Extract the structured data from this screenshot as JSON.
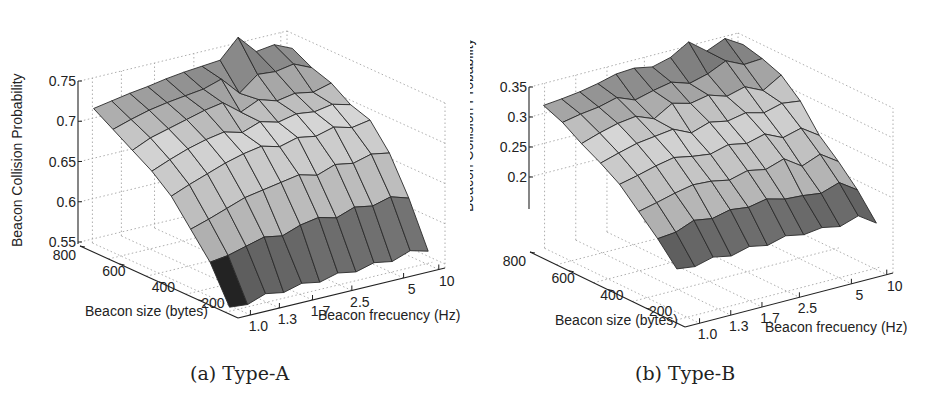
{
  "figure": {
    "panels": [
      {
        "caption": "(a) Type-A",
        "zlabel": "Beacon Collision Probability",
        "xlabel": "Beacon size (bytes)",
        "ylabel": "Beacon frecuency (Hz)"
      },
      {
        "caption": "(b) Type-B",
        "zlabel": "Beacon Collision Probability",
        "xlabel": "Beacon size (bytes)",
        "ylabel": "Beacon frecuency (Hz)"
      }
    ]
  },
  "chart_data": [
    {
      "type": "surface",
      "title": "(a) Type-A",
      "xlabel": "Beacon size (bytes)",
      "ylabel": "Beacon frecuency (Hz)",
      "zlabel": "Beacon Collision Probability",
      "x_ticks": [
        "200",
        "400",
        "600",
        "800"
      ],
      "y_ticks": [
        "1.0",
        "1.3",
        "1.7",
        "2.5",
        "5",
        "10"
      ],
      "z_ticks": [
        "0.55",
        "0.6",
        "0.65",
        "0.7",
        "0.75"
      ],
      "zlim": [
        0.55,
        0.75
      ],
      "grid": true,
      "note": "Rows = beacon size from 800 (back-left) down to ~100; columns = beacon frequency grid from 1.0 to 10 Hz. Values estimated visually.",
      "x": [
        800,
        700,
        600,
        500,
        400,
        300,
        200,
        100
      ],
      "y": [
        1.0,
        1.1,
        1.2,
        1.3,
        1.5,
        1.7,
        2.0,
        2.5,
        3.3,
        5,
        7,
        10
      ],
      "z": [
        [
          0.72,
          0.724,
          0.728,
          0.731,
          0.735,
          0.738,
          0.74,
          0.742,
          0.765,
          0.742,
          0.745,
          0.735
        ],
        [
          0.705,
          0.712,
          0.718,
          0.722,
          0.725,
          0.728,
          0.735,
          0.712,
          0.73,
          0.728,
          0.732,
          0.722
        ],
        [
          0.69,
          0.7,
          0.706,
          0.712,
          0.718,
          0.722,
          0.705,
          0.715,
          0.708,
          0.712,
          0.708,
          0.714
        ],
        [
          0.675,
          0.684,
          0.692,
          0.698,
          0.702,
          0.696,
          0.704,
          0.698,
          0.703,
          0.7,
          0.704,
          0.698
        ],
        [
          0.655,
          0.664,
          0.672,
          0.68,
          0.686,
          0.69,
          0.684,
          0.69,
          0.686,
          0.692,
          0.686,
          0.69
        ],
        [
          0.625,
          0.632,
          0.64,
          0.648,
          0.652,
          0.656,
          0.66,
          0.654,
          0.662,
          0.658,
          0.664,
          0.66
        ],
        [
          0.595,
          0.598,
          0.604,
          0.61,
          0.606,
          0.614,
          0.618,
          0.612,
          0.62,
          0.616,
          0.622,
          0.615
        ],
        [
          0.55,
          0.548,
          0.556,
          0.552,
          0.558,
          0.554,
          0.56,
          0.556,
          0.562,
          0.558,
          0.566,
          0.56
        ]
      ]
    },
    {
      "type": "surface",
      "title": "(b) Type-B",
      "xlabel": "Beacon size (bytes)",
      "ylabel": "Beacon frecuency (Hz)",
      "zlabel": "Beacon Collision Probability",
      "x_ticks": [
        "200",
        "400",
        "600",
        "800"
      ],
      "y_ticks": [
        "1.0",
        "1.3",
        "1.7",
        "2.5",
        "5",
        "10"
      ],
      "z_ticks": [
        "0.2",
        "0.25",
        "0.3",
        "0.35"
      ],
      "zlim": [
        0.15,
        0.35
      ],
      "grid": true,
      "note": "Rows = beacon size from 800 (back-left) down to ~100; columns = beacon frequency grid from 1.0 to 10 Hz. Values estimated visually.",
      "x": [
        800,
        700,
        600,
        500,
        400,
        300,
        200,
        100
      ],
      "y": [
        1.0,
        1.1,
        1.2,
        1.3,
        1.5,
        1.7,
        2.0,
        2.5,
        3.3,
        5,
        7,
        10
      ],
      "z": [
        [
          0.325,
          0.328,
          0.332,
          0.338,
          0.346,
          0.348,
          0.342,
          0.35,
          0.368,
          0.345,
          0.358,
          0.34
        ],
        [
          0.312,
          0.318,
          0.322,
          0.33,
          0.318,
          0.326,
          0.332,
          0.322,
          0.33,
          0.344,
          0.33,
          0.332
        ],
        [
          0.292,
          0.302,
          0.31,
          0.314,
          0.302,
          0.32,
          0.312,
          0.318,
          0.308,
          0.316,
          0.302,
          0.32
        ],
        [
          0.275,
          0.284,
          0.292,
          0.296,
          0.3,
          0.286,
          0.296,
          0.29,
          0.296,
          0.288,
          0.296,
          0.292
        ],
        [
          0.255,
          0.262,
          0.27,
          0.276,
          0.27,
          0.266,
          0.274,
          0.268,
          0.276,
          0.262,
          0.27,
          0.25
        ],
        [
          0.225,
          0.232,
          0.24,
          0.246,
          0.244,
          0.238,
          0.246,
          0.24,
          0.25,
          0.23,
          0.242,
          0.222
        ],
        [
          0.195,
          0.198,
          0.21,
          0.205,
          0.212,
          0.208,
          0.214,
          0.206,
          0.204,
          0.2,
          0.21,
          0.19
        ],
        [
          0.16,
          0.156,
          0.164,
          0.158,
          0.166,
          0.16,
          0.168,
          0.162,
          0.166,
          0.16,
          0.17,
          0.15
        ]
      ]
    }
  ],
  "layout": {
    "panels": [
      {
        "z_axis_x": 78,
        "z_top": 81,
        "z_bottom": 242,
        "corner_back": [
          80,
          246
        ],
        "corner_front": [
          238,
          318
        ],
        "corner_right": [
          445,
          268
        ],
        "x_tick_pos": [
          0.82,
          0.58,
          0.33,
          0.08
        ],
        "y_tick_pos": [
          0.06,
          0.2,
          0.36,
          0.55,
          0.8,
          0.97
        ],
        "surface_origin": [
          100,
          120
        ],
        "caption_pos": [
          190,
          375
        ]
      },
      {
        "z_axis_x": 59,
        "z_top": 87,
        "z_bottom": 207,
        "corner_back": [
          60,
          252
        ],
        "corner_front": [
          215,
          327
        ],
        "corner_right": [
          423,
          273
        ],
        "x_tick_pos": [
          0.83,
          0.59,
          0.34,
          0.08
        ],
        "y_tick_pos": [
          0.07,
          0.22,
          0.37,
          0.55,
          0.8,
          0.97
        ],
        "surface_origin": [
          80,
          115
        ],
        "caption_pos": [
          165,
          375
        ]
      }
    ]
  }
}
